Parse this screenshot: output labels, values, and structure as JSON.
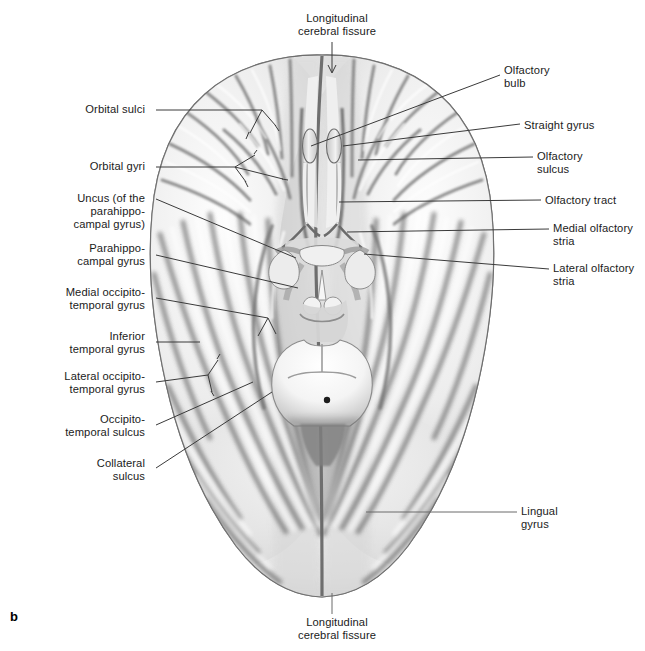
{
  "figure": {
    "letter": "b",
    "view": "inferior-view-of-brain",
    "background_color": "#ffffff",
    "leader_color": "#3a3a3a",
    "text_color": "#1b1b1b"
  },
  "labels": {
    "top_center": {
      "text": "Longitudinal\ncerebral fissure",
      "side": "center",
      "x": 337,
      "y": 12,
      "leader": "arrow-down"
    },
    "bottom_center": {
      "text": "Longitudinal\ncerebral fissure",
      "side": "center",
      "x": 337,
      "y": 616,
      "leader": "plain-line"
    },
    "left": [
      {
        "text": "Orbital sulci",
        "x": 145,
        "y": 103,
        "lines": 1
      },
      {
        "text": "Orbital gyri",
        "x": 145,
        "y": 160,
        "lines": 1
      },
      {
        "text": "Uncus (of the\nparahippo-\ncampal gyrus)",
        "x": 145,
        "y": 195,
        "lines": 3
      },
      {
        "text": "Parahippo-\ncampal gyrus",
        "x": 145,
        "y": 248,
        "lines": 2
      },
      {
        "text": "Medial occipito-\ntemporal gyrus",
        "x": 145,
        "y": 292,
        "lines": 2
      },
      {
        "text": "Inferior\ntemporal gyrus",
        "x": 145,
        "y": 336,
        "lines": 2
      },
      {
        "text": "Lateral occipito-\ntemporal gyrus",
        "x": 145,
        "y": 375,
        "lines": 2
      },
      {
        "text": "Occipito-\ntemporal sulcus",
        "x": 145,
        "y": 419,
        "lines": 2
      },
      {
        "text": "Collateral\nsulcus",
        "x": 145,
        "y": 462,
        "lines": 2
      }
    ],
    "right": [
      {
        "text": "Olfactory\nbulb",
        "x": 504,
        "y": 65,
        "lines": 2
      },
      {
        "text": "Straight gyrus",
        "x": 524,
        "y": 120,
        "lines": 1
      },
      {
        "text": "Olfactory\nsulcus",
        "x": 537,
        "y": 150,
        "lines": 2
      },
      {
        "text": "Olfactory tract",
        "x": 545,
        "y": 194,
        "lines": 1
      },
      {
        "text": "Medial olfactory\nstria",
        "x": 553,
        "y": 222,
        "lines": 2
      },
      {
        "text": "Lateral olfactory\nstria",
        "x": 553,
        "y": 262,
        "lines": 2
      },
      {
        "text": "Lingual\ngyrus",
        "x": 521,
        "y": 505,
        "lines": 2
      }
    ]
  }
}
